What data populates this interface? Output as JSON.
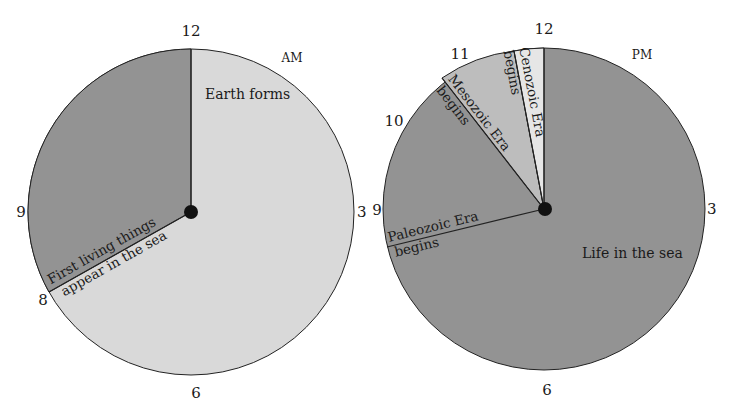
{
  "colors": {
    "dark": "#939393",
    "light": "#d9d9d9",
    "mid": "#bdbdbd",
    "lightest": "#e6e6e6",
    "line": "#222222"
  },
  "left_clock": {
    "period": "AM",
    "hours": {
      "h12": "12",
      "h3": "3",
      "h6": "6",
      "h9": "9",
      "h8": "8"
    },
    "regions": [
      {
        "name": "Earth forms",
        "label": "Earth forms"
      }
    ],
    "event": {
      "line1": "First living things",
      "line2": "appear in the sea"
    }
  },
  "right_clock": {
    "period": "PM",
    "hours": {
      "h12": "12",
      "h3": "3",
      "h6": "6",
      "h9": "9",
      "h10": "10",
      "h11": "11"
    },
    "main_label": "Life in the sea",
    "events": {
      "paleozoic": {
        "line1": "Paleozoic Era",
        "line2": "begins"
      },
      "mesozoic": {
        "line1": "Mesozoic Era",
        "line2": "begins"
      },
      "cenozoic": {
        "line1": "Cenozoic Era",
        "line2": "begins"
      }
    }
  }
}
